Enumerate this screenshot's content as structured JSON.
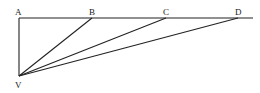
{
  "diagram": {
    "type": "geometric-figure",
    "points": [
      {
        "id": "A",
        "label": "A",
        "x": 19,
        "y": 18,
        "label_x": 15,
        "label_y": 15
      },
      {
        "id": "B",
        "label": "B",
        "x": 92,
        "y": 18,
        "label_x": 89,
        "label_y": 15
      },
      {
        "id": "C",
        "label": "C",
        "x": 166,
        "y": 18,
        "label_x": 163,
        "label_y": 15
      },
      {
        "id": "D",
        "label": "D",
        "x": 238,
        "y": 18,
        "label_x": 235,
        "label_y": 15
      },
      {
        "id": "V",
        "label": "V",
        "x": 19,
        "y": 76,
        "label_x": 15,
        "label_y": 88
      }
    ],
    "segments": [
      {
        "from": "A",
        "to": "END",
        "note": "horizontal line extending past D"
      },
      {
        "from": "A",
        "to": "V"
      },
      {
        "from": "V",
        "to": "B"
      },
      {
        "from": "V",
        "to": "C"
      },
      {
        "from": "V",
        "to": "D"
      }
    ],
    "line_end_x": 253,
    "stroke_color": "#222222"
  }
}
